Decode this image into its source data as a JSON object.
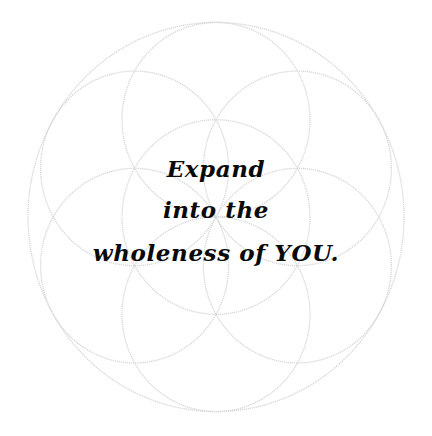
{
  "image": {
    "background_color": "#ffffff",
    "pattern_name": "seed-of-life",
    "pattern_color": "#d9d9d9",
    "text_color": "#0a0a0a"
  },
  "quote": {
    "lines": [
      "Expand",
      "into the",
      "wholeness of YOU."
    ]
  }
}
